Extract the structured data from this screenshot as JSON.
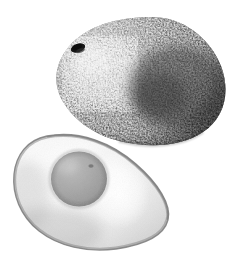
{
  "scene": {
    "title": "Avocado photograph",
    "description": "Grayscale photograph of a whole Hass avocado with pebbled skin above a halved avocado showing pale flesh and a round pit cavity",
    "background_color": "#ffffff",
    "width": 230,
    "height": 263,
    "color_mode": "grayscale"
  },
  "objects": {
    "whole_avocado": {
      "label": "whole avocado",
      "skin_texture": "pebbled",
      "bounds": {
        "x": 57,
        "y": 17,
        "width": 170,
        "height": 129
      },
      "tone_dark": "#2b2b2b",
      "tone_mid": "#6e6e6e",
      "tone_light": "#d8d8d8",
      "speckle_color": "#e8e8e8",
      "stem_scar": {
        "label": "stem scar",
        "x": 77,
        "y": 48,
        "color": "#1a1a1a"
      }
    },
    "halved_avocado": {
      "label": "halved avocado",
      "bounds": {
        "x": 12,
        "y": 132,
        "width": 158,
        "height": 119
      },
      "flesh_light": "#f4f4f4",
      "flesh_mid": "#e0e0e0",
      "flesh_shadow": "#c2c2c2",
      "rind_color": "#8d8d8d",
      "pit_cavity": {
        "label": "pit cavity",
        "cx": 79,
        "cy": 179,
        "rx": 28,
        "ry": 27,
        "color": "#a6a6a6",
        "shadow_color": "#8f8f8f"
      },
      "highlight": {
        "label": "flesh highlight",
        "color": "#fdfdfd"
      }
    }
  }
}
